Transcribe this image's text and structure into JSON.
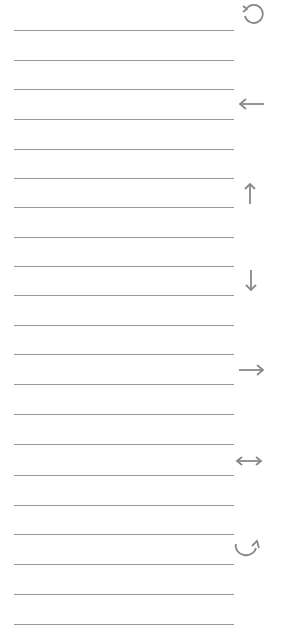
{
  "page": {
    "line_color": "#9a9a9a",
    "icon_color": "#888888",
    "line_count": 21
  },
  "lines": [
    30,
    59.5,
    89,
    118.5,
    148.5,
    178,
    207,
    237,
    266,
    295,
    325,
    354,
    384,
    414,
    444,
    474.5,
    504.5,
    534,
    564,
    594,
    624
  ],
  "icons": [
    {
      "name": "rotate-counterclockwise-icon",
      "y": 14
    },
    {
      "name": "arrow-left-icon",
      "y": 104
    },
    {
      "name": "arrow-up-icon",
      "y": 193
    },
    {
      "name": "arrow-down-icon",
      "y": 283
    },
    {
      "name": "arrow-right-icon",
      "y": 370
    },
    {
      "name": "arrow-left-right-icon",
      "y": 461
    },
    {
      "name": "rotate-clockwise-icon",
      "y": 548
    }
  ]
}
